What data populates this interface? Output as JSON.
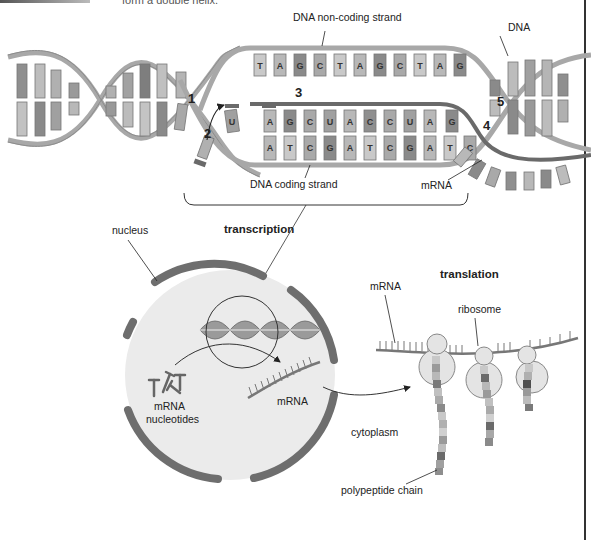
{
  "header": {
    "caption_fragment": "form a double helix."
  },
  "transcription_detail": {
    "labels": {
      "non_coding_strand": "DNA non-coding strand",
      "coding_strand": "DNA coding strand",
      "dna": "DNA",
      "mrna": "mRNA"
    },
    "step_numbers": [
      "1",
      "2",
      "3",
      "4",
      "5"
    ],
    "non_coding_bases": [
      "T",
      "A",
      "G",
      "C",
      "T",
      "A",
      "G",
      "C",
      "T",
      "A",
      "G"
    ],
    "mrna_bases": [
      "U",
      "A",
      "G",
      "C",
      "U",
      "A",
      "C",
      "C",
      "U",
      "A",
      "G"
    ],
    "coding_bases": [
      "A",
      "T",
      "C",
      "G",
      "A",
      "T",
      "C",
      "G",
      "A",
      "T",
      "C"
    ],
    "base_colors": {
      "A": "#b8b8b8",
      "T": "#c9c9c9",
      "G": "#8a8a8a",
      "C": "#a9a9a9",
      "U": "#a0a0a0"
    }
  },
  "overview": {
    "transcription_title": "transcription",
    "translation_title": "translation",
    "labels": {
      "nucleus": "nucleus",
      "mrna_nucleotides_line1": "mRNA",
      "mrna_nucleotides_line2": "nucleotides",
      "mrna_in_nucleus": "mRNA",
      "mrna_cytoplasm": "mRNA",
      "ribosome": "ribosome",
      "cytoplasm": "cytoplasm",
      "polypeptide_chain": "polypeptide chain"
    }
  },
  "colors": {
    "backbone": "#a8a8a8",
    "backbone_dark": "#7a7a7a",
    "nucleus_membrane": "#6e6e6e",
    "nucleus_fill": "#ebebeb",
    "ribosome_fill": "#e4e4e4",
    "ink": "#222222"
  }
}
